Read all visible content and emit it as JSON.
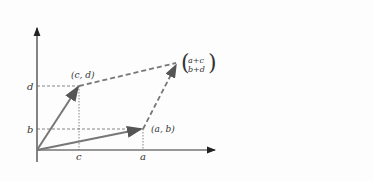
{
  "diagram": {
    "colors": {
      "axis": "#333333",
      "vector": "#777777",
      "dashed": "#777777",
      "guide": "#666666"
    },
    "axes": {
      "origin": [
        37,
        150
      ],
      "x_end": [
        215,
        150
      ],
      "y_end": [
        37,
        28
      ]
    },
    "tick_labels": {
      "x": [
        "c",
        "a"
      ],
      "y": [
        "d",
        "b"
      ]
    },
    "points": {
      "cd": {
        "label": "(c, d)",
        "pos": [
          79,
          86
        ]
      },
      "ab": {
        "label": "(a, b)",
        "pos": [
          143,
          129
        ]
      },
      "sum": {
        "top": "a+c",
        "bottom": "b+d",
        "pos": [
          177,
          63
        ]
      }
    }
  }
}
